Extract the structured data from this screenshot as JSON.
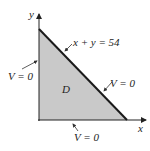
{
  "diagram": {
    "axes": {
      "x_label": "x",
      "y_label": "y"
    },
    "region_label": "D",
    "hypotenuse_label": "x + y = 54",
    "boundary_labels": {
      "left": "V = 0",
      "hypotenuse": "V = 0",
      "bottom": "V = 0"
    },
    "colors": {
      "fill": "#c8c8c8",
      "line": "#1a1a1a"
    }
  }
}
